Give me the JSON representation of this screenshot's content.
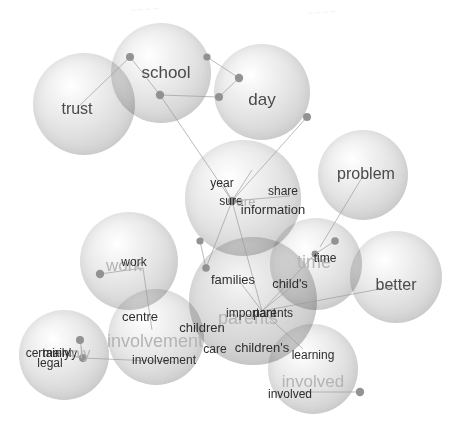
{
  "figure": {
    "type": "bubble-word-network",
    "width": 457,
    "height": 443,
    "background": "#ffffff",
    "edge_color": "#9a9a9a",
    "node_color": "#8d8d8d",
    "big_label_color": "#b4b4b4",
    "small_label_color": "#2e2e2e"
  },
  "bubbles": [
    {
      "name": "trust",
      "cx": 84,
      "cy": 104,
      "r": 51,
      "dim": false
    },
    {
      "name": "school",
      "cx": 161,
      "cy": 73,
      "r": 50,
      "dim": false
    },
    {
      "name": "day",
      "cx": 262,
      "cy": 92,
      "r": 48,
      "dim": false
    },
    {
      "name": "problem",
      "cx": 363,
      "cy": 175,
      "r": 45,
      "dim": false
    },
    {
      "name": "year-share",
      "cx": 243,
      "cy": 198,
      "r": 58,
      "dim": false
    },
    {
      "name": "time",
      "cx": 316,
      "cy": 264,
      "r": 46,
      "dim": false
    },
    {
      "name": "better",
      "cx": 396,
      "cy": 277,
      "r": 46,
      "dim": false
    },
    {
      "name": "work",
      "cx": 129,
      "cy": 261,
      "r": 49,
      "dim": false
    },
    {
      "name": "centre",
      "cx": 156,
      "cy": 337,
      "r": 48,
      "dim": false
    },
    {
      "name": "certainly",
      "cx": 64,
      "cy": 355,
      "r": 45,
      "dim": false
    },
    {
      "name": "parents-core",
      "cx": 253,
      "cy": 301,
      "r": 64,
      "dim": true
    },
    {
      "name": "involved",
      "cx": 313,
      "cy": 369,
      "r": 45,
      "dim": false
    }
  ],
  "labels": [
    {
      "text": "trust",
      "x": 77,
      "y": 109,
      "size": 16,
      "style": "solo"
    },
    {
      "text": "school",
      "x": 166,
      "y": 72,
      "size": 17,
      "style": "solo"
    },
    {
      "text": "day",
      "x": 262,
      "y": 99,
      "size": 17,
      "style": "solo"
    },
    {
      "text": "problem",
      "x": 366,
      "y": 174,
      "size": 16,
      "style": "solo"
    },
    {
      "text": "year",
      "x": 222,
      "y": 183,
      "size": 12,
      "style": "small"
    },
    {
      "text": "sure",
      "x": 231,
      "y": 201,
      "size": 12,
      "style": "small"
    },
    {
      "text": "are",
      "x": 246,
      "y": 201,
      "size": 13,
      "style": "big"
    },
    {
      "text": "share",
      "x": 283,
      "y": 191,
      "size": 12,
      "style": "small"
    },
    {
      "text": "information",
      "x": 273,
      "y": 209,
      "size": 13,
      "style": "small"
    },
    {
      "text": "work",
      "x": 124,
      "y": 265,
      "size": 17,
      "style": "big"
    },
    {
      "text": "work",
      "x": 134,
      "y": 262,
      "size": 12,
      "style": "small"
    },
    {
      "text": "time",
      "x": 314,
      "y": 262,
      "size": 18,
      "style": "big"
    },
    {
      "text": "time",
      "x": 325,
      "y": 258,
      "size": 12,
      "style": "small"
    },
    {
      "text": "better",
      "x": 396,
      "y": 285,
      "size": 16,
      "style": "solo"
    },
    {
      "text": "families",
      "x": 233,
      "y": 279,
      "size": 13,
      "style": "small"
    },
    {
      "text": "child's",
      "x": 290,
      "y": 283,
      "size": 13,
      "style": "small"
    },
    {
      "text": "centre",
      "x": 140,
      "y": 316,
      "size": 13,
      "style": "small"
    },
    {
      "text": "involvement",
      "x": 155,
      "y": 341,
      "size": 18,
      "style": "big"
    },
    {
      "text": "involvement",
      "x": 164,
      "y": 360,
      "size": 12,
      "style": "small"
    },
    {
      "text": "certainly",
      "x": 48,
      "y": 353,
      "size": 12,
      "style": "small"
    },
    {
      "text": "mainly",
      "x": 60,
      "y": 353,
      "size": 12,
      "style": "small"
    },
    {
      "text": "nly",
      "x": 81,
      "y": 352,
      "size": 15,
      "style": "big"
    },
    {
      "text": "legal",
      "x": 50,
      "y": 363,
      "size": 12,
      "style": "small"
    },
    {
      "text": "parents",
      "x": 248,
      "y": 318,
      "size": 18,
      "style": "big"
    },
    {
      "text": "important",
      "x": 251,
      "y": 313,
      "size": 12,
      "style": "small"
    },
    {
      "text": "parents",
      "x": 273,
      "y": 313,
      "size": 12,
      "style": "small"
    },
    {
      "text": "children",
      "x": 202,
      "y": 327,
      "size": 13,
      "style": "small"
    },
    {
      "text": "care",
      "x": 215,
      "y": 349,
      "size": 12,
      "style": "small"
    },
    {
      "text": "children's",
      "x": 262,
      "y": 347,
      "size": 13,
      "style": "small"
    },
    {
      "text": "learning",
      "x": 313,
      "y": 355,
      "size": 12,
      "style": "small"
    },
    {
      "text": "involved",
      "x": 313,
      "y": 381,
      "size": 17,
      "style": "big"
    },
    {
      "text": "involved",
      "x": 290,
      "y": 394,
      "size": 12,
      "style": "small"
    }
  ],
  "nodes": [
    {
      "x": 130,
      "y": 57,
      "r": 4.0
    },
    {
      "x": 207,
      "y": 57,
      "r": 3.6
    },
    {
      "x": 160,
      "y": 95,
      "r": 4.2
    },
    {
      "x": 239,
      "y": 78,
      "r": 4.2
    },
    {
      "x": 219,
      "y": 97,
      "r": 4.0
    },
    {
      "x": 307,
      "y": 117,
      "r": 4.0
    },
    {
      "x": 232,
      "y": 201,
      "r": 4.2
    },
    {
      "x": 200,
      "y": 241,
      "r": 3.6
    },
    {
      "x": 206,
      "y": 268,
      "r": 3.8
    },
    {
      "x": 100,
      "y": 274,
      "r": 4.2
    },
    {
      "x": 335,
      "y": 241,
      "r": 3.8
    },
    {
      "x": 315,
      "y": 254,
      "r": 3.4
    },
    {
      "x": 80,
      "y": 340,
      "r": 4.0
    },
    {
      "x": 83,
      "y": 358,
      "r": 4.0
    },
    {
      "x": 360,
      "y": 392,
      "r": 4.2
    }
  ],
  "edges": [
    {
      "x1": 130,
      "y1": 57,
      "x2": 77,
      "y2": 108
    },
    {
      "x1": 130,
      "y1": 57,
      "x2": 160,
      "y2": 95
    },
    {
      "x1": 207,
      "y1": 57,
      "x2": 239,
      "y2": 78
    },
    {
      "x1": 239,
      "y1": 78,
      "x2": 219,
      "y2": 97
    },
    {
      "x1": 160,
      "y1": 95,
      "x2": 219,
      "y2": 97
    },
    {
      "x1": 160,
      "y1": 95,
      "x2": 232,
      "y2": 201
    },
    {
      "x1": 307,
      "y1": 117,
      "x2": 232,
      "y2": 201
    },
    {
      "x1": 232,
      "y1": 201,
      "x2": 290,
      "y2": 196
    },
    {
      "x1": 232,
      "y1": 201,
      "x2": 221,
      "y2": 180
    },
    {
      "x1": 232,
      "y1": 201,
      "x2": 252,
      "y2": 170
    },
    {
      "x1": 232,
      "y1": 201,
      "x2": 206,
      "y2": 268
    },
    {
      "x1": 200,
      "y1": 241,
      "x2": 206,
      "y2": 268
    },
    {
      "x1": 100,
      "y1": 274,
      "x2": 143,
      "y2": 268
    },
    {
      "x1": 143,
      "y1": 268,
      "x2": 152,
      "y2": 330
    },
    {
      "x1": 232,
      "y1": 201,
      "x2": 262,
      "y2": 311
    },
    {
      "x1": 262,
      "y1": 311,
      "x2": 240,
      "y2": 282
    },
    {
      "x1": 262,
      "y1": 311,
      "x2": 290,
      "y2": 288
    },
    {
      "x1": 262,
      "y1": 311,
      "x2": 315,
      "y2": 254
    },
    {
      "x1": 315,
      "y1": 254,
      "x2": 335,
      "y2": 241
    },
    {
      "x1": 262,
      "y1": 311,
      "x2": 303,
      "y2": 349
    },
    {
      "x1": 262,
      "y1": 311,
      "x2": 396,
      "y2": 286
    },
    {
      "x1": 363,
      "y1": 176,
      "x2": 320,
      "y2": 247
    },
    {
      "x1": 80,
      "y1": 340,
      "x2": 83,
      "y2": 358
    },
    {
      "x1": 83,
      "y1": 358,
      "x2": 52,
      "y2": 352
    },
    {
      "x1": 83,
      "y1": 358,
      "x2": 175,
      "y2": 362
    },
    {
      "x1": 360,
      "y1": 392,
      "x2": 300,
      "y2": 392
    }
  ],
  "smudges": [
    {
      "text": "~~~~",
      "x": 145,
      "y": 9
    },
    {
      "text": "~~~~",
      "x": 322,
      "y": 12
    }
  ]
}
